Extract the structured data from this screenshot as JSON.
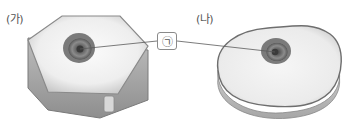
{
  "diagram": {
    "type": "cell-comparison",
    "panels": [
      {
        "id": "a",
        "label": "(가)",
        "shape": "hexagonal-prism"
      },
      {
        "id": "b",
        "label": "(나)",
        "shape": "rounded-irregular-slab"
      }
    ],
    "callout": {
      "label": "㉠",
      "points_to": [
        "nucleus of (가)",
        "nucleus of (나)"
      ]
    },
    "colors": {
      "cell_top": "#ececec",
      "cell_edge": "#7a7a7a",
      "cell_side": "#a8a8a8",
      "nucleus_outer": "#6f6f6f",
      "nucleus_inner": "#4a4a4a",
      "leader_line": "#5a5a5a"
    }
  }
}
